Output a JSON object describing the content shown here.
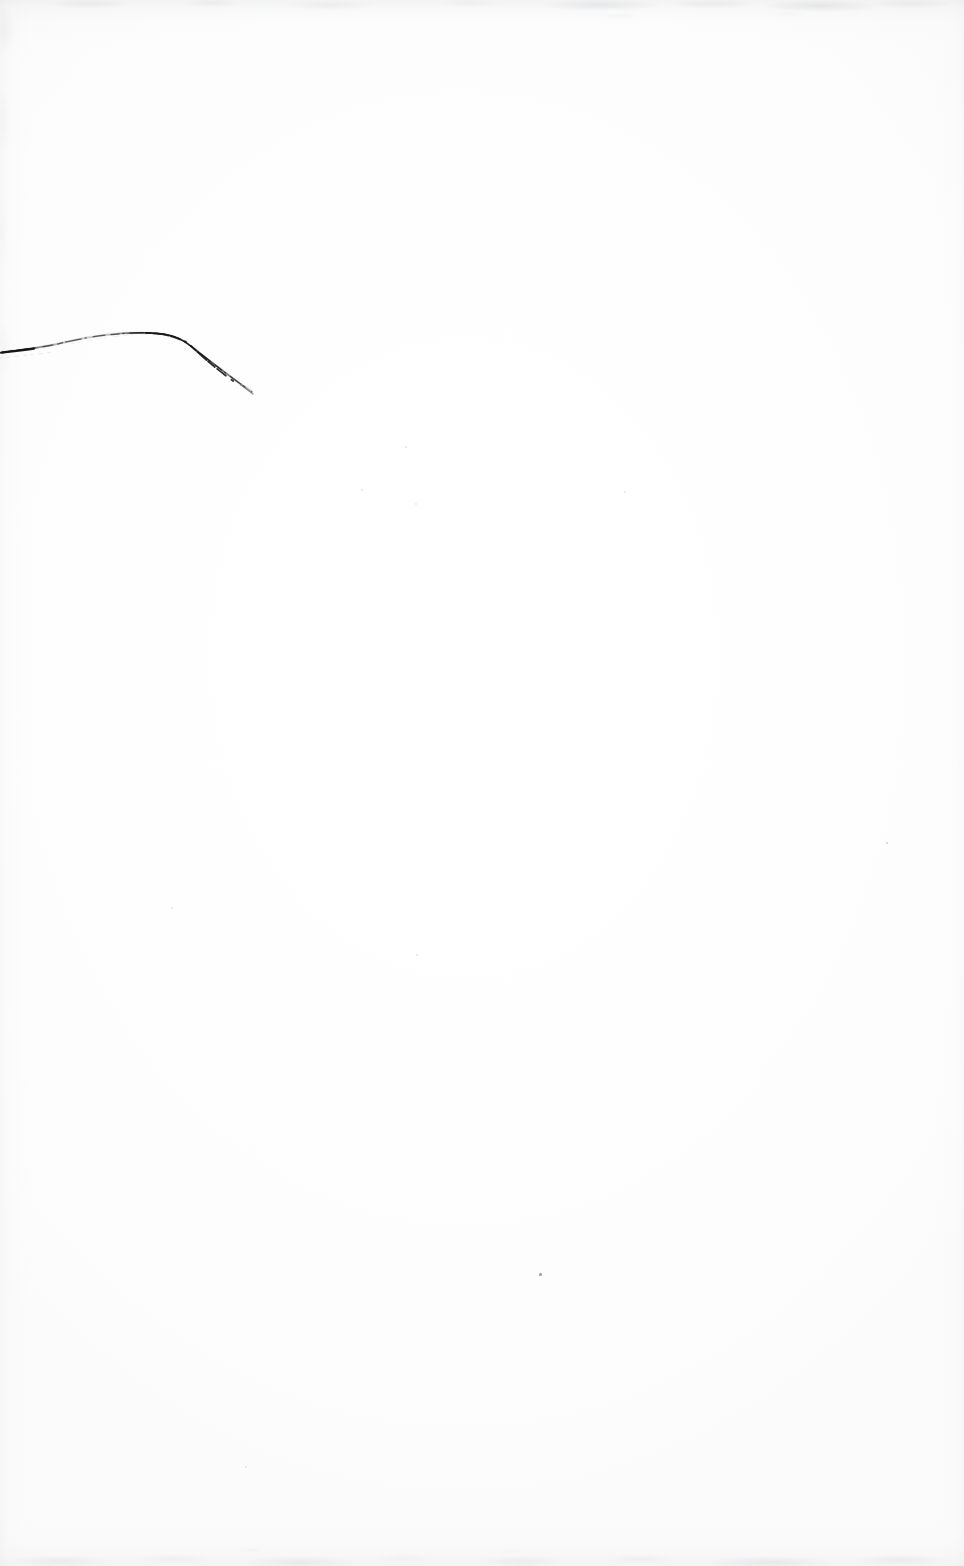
{
  "document": {
    "kind": "scanned-page",
    "title": "Scanned blank page with handwritten pen stroke",
    "page_width": 964,
    "page_height": 1566,
    "paper_color": "#fefefe",
    "background_color": "#ffffff",
    "text_content": "",
    "visible_text": "none",
    "caption": ""
  },
  "ink": {
    "label": "pen-stroke",
    "color": "#1c1c1c",
    "secondary_color": "#5a5a5a",
    "description": "single broken ballpoint arc in upper-left quadrant",
    "start_point": "0,352",
    "crest_point": "165,333",
    "end_point": "252,392"
  },
  "artifacts": {
    "edge_noise_color": "#a6a9ae",
    "speck_color": "#4a4a4a",
    "specks": [
      {
        "name": "speck-lower-center",
        "x": 540,
        "y": 1274,
        "size": 3.0,
        "opacity": 0.55
      },
      {
        "name": "speck-right-mid",
        "x": 887,
        "y": 843,
        "size": 2.4,
        "opacity": 0.26
      },
      {
        "name": "speck-upper-right",
        "x": 406,
        "y": 447,
        "size": 2.0,
        "opacity": 0.16
      },
      {
        "name": "speck-mid-left",
        "x": 172,
        "y": 908,
        "size": 2.2,
        "opacity": 0.14
      },
      {
        "name": "speck-center",
        "x": 362,
        "y": 490,
        "size": 1.8,
        "opacity": 0.13
      },
      {
        "name": "speck-mid-right",
        "x": 625,
        "y": 492,
        "size": 1.8,
        "opacity": 0.12
      },
      {
        "name": "speck-low-right",
        "x": 417,
        "y": 955,
        "size": 1.6,
        "opacity": 0.11
      },
      {
        "name": "speck-far-right",
        "x": 416,
        "y": 504,
        "size": 1.5,
        "opacity": 0.1
      },
      {
        "name": "speck-bottom-left",
        "x": 246,
        "y": 1467,
        "size": 1.6,
        "opacity": 0.12
      }
    ]
  }
}
